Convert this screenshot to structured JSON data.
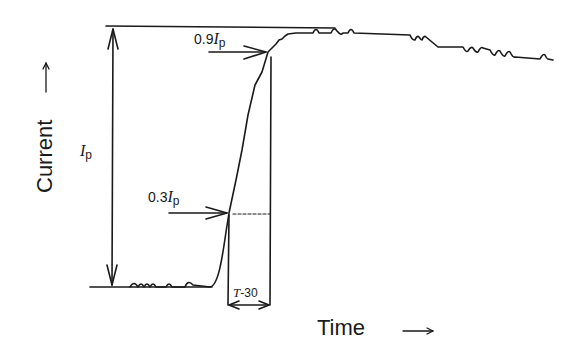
{
  "diagram": {
    "title": "",
    "y_axis_label": "Current",
    "y_axis_arrow": "→",
    "x_axis_label": "Time",
    "x_axis_arrow": "→",
    "peak_label": {
      "symbol": "I",
      "subscript": "p"
    },
    "level_90": {
      "prefix": "0.9",
      "symbol": "I",
      "subscript": "p"
    },
    "level_30": {
      "prefix": "0.3",
      "symbol": "I",
      "subscript": "p"
    },
    "interval_label": {
      "symbol": "T",
      "suffix": "-30"
    },
    "line_color": "#1a1a1a",
    "background": "#ffffff"
  }
}
